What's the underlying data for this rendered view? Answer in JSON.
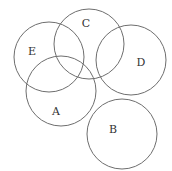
{
  "diagram": {
    "type": "venn",
    "stroke_color": "#6e6e6e",
    "label_color": "#333333",
    "sets": [
      {
        "id": "E",
        "label": "E",
        "cx": 49,
        "cy": 57,
        "r": 35,
        "lx": 32,
        "ly": 51
      },
      {
        "id": "C",
        "label": "C",
        "cx": 89,
        "cy": 44,
        "r": 35,
        "lx": 86,
        "ly": 23
      },
      {
        "id": "D",
        "label": "D",
        "cx": 131,
        "cy": 60,
        "r": 35,
        "lx": 141,
        "ly": 62
      },
      {
        "id": "A",
        "label": "A",
        "cx": 61,
        "cy": 91,
        "r": 35,
        "lx": 56,
        "ly": 111
      },
      {
        "id": "B",
        "label": "B",
        "cx": 122,
        "cy": 134,
        "r": 35,
        "lx": 113,
        "ly": 129
      }
    ]
  }
}
